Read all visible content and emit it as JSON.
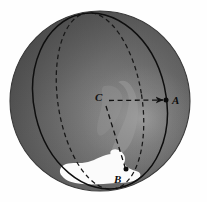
{
  "figure": {
    "name": "sphere-great-circle-diagram",
    "background_color": "#fefefe"
  },
  "sphere": {
    "name": "shaded-sphere",
    "center": {
      "x": 100,
      "y": 101
    },
    "radius": 90,
    "fill_dark": "#4f4f4f",
    "fill_mid": "#5e5e5e",
    "fill_light": "#9a9a9a",
    "edge_color": "#3b3b3b"
  },
  "landmass": {
    "name": "white-landmass",
    "fill": "#fbfbfb",
    "description": "white continent shape near bottom of sphere"
  },
  "curves": {
    "meridian": {
      "name": "dashed-great-circle",
      "style": "dashed",
      "color": "#1c1c1c",
      "description": "dashed ellipse great circle through the sphere"
    },
    "arc_AB": {
      "name": "solid-great-circle-arc",
      "style": "solid",
      "color": "#101010",
      "description": "solid arc passing through A and B"
    }
  },
  "segments": [
    {
      "name": "radius-C-to-A",
      "from": "C",
      "to": "A",
      "style": "dashed",
      "arrowhead": true,
      "color": "#111111"
    },
    {
      "name": "radius-C-to-B",
      "from": "C",
      "to": "B",
      "style": "dashed",
      "arrowhead": false,
      "color": "#111111"
    }
  ],
  "points": {
    "A": {
      "label": "A",
      "x": 166,
      "y": 100,
      "marker": "filled-dot"
    },
    "B": {
      "label": "B",
      "x": 126,
      "y": 169,
      "marker": "filled-dot"
    },
    "C": {
      "label": "C",
      "x": 105,
      "y": 101,
      "marker": "none"
    }
  }
}
